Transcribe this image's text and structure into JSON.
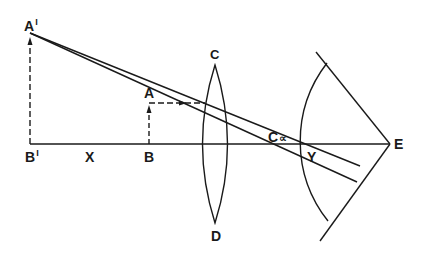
{
  "diagram": {
    "line_color": "#1a1a1a",
    "labels": {
      "a_prime": "A",
      "a_prime_mark": "I",
      "b_prime": "B",
      "b_prime_mark": "I",
      "x": "X",
      "a": "A",
      "b": "B",
      "c": "C",
      "d": "D",
      "c_inf": "C",
      "c_inf_mark": "∝",
      "y": "Y",
      "e": "E"
    }
  }
}
